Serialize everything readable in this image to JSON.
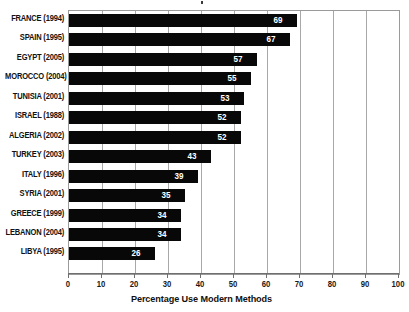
{
  "chart_data": {
    "type": "bar",
    "orientation": "horizontal",
    "title": "",
    "xlabel": "Percentage Use Modern Methods",
    "ylabel": "",
    "xlim": [
      0,
      100
    ],
    "xticks": [
      0,
      10,
      20,
      30,
      40,
      50,
      60,
      70,
      80,
      90,
      100
    ],
    "grid": true,
    "legend": null,
    "bar_color": "#080808",
    "value_label_color": "#ffffff",
    "categories": [
      "FRANCE (1994)",
      "SPAIN (1995)",
      "EGYPT (2005)",
      "MOROCCO (2004)",
      "TUNISIA (2001)",
      "ISRAEL (1988)",
      "ALGERIA (2002)",
      "TURKEY (2003)",
      "ITALY (1996)",
      "SYRIA (2001)",
      "GREECE (1999)",
      "LEBANON (2004)",
      "LIBYA (1995)"
    ],
    "values": [
      69,
      67,
      57,
      55,
      53,
      52,
      52,
      43,
      39,
      35,
      34,
      34,
      26
    ],
    "value_labels": [
      "69",
      "67",
      "57",
      "55",
      "53",
      "52",
      "52",
      "43",
      "39",
      "35",
      "34",
      "34",
      "26"
    ]
  }
}
